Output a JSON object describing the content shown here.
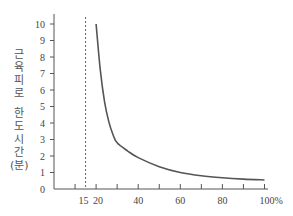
{
  "chart_data": {
    "type": "line",
    "title": "",
    "xlabel": "",
    "ylabel": "근육피로 한도시간 (분)",
    "ylabel_lines": [
      "근",
      "육",
      "피",
      "로",
      "",
      "한",
      "도",
      "시",
      "간",
      "(분)"
    ],
    "x_tick_labels": [
      "15",
      "20",
      "40",
      "60",
      "80",
      "100%"
    ],
    "x_tick_values": [
      15,
      20,
      40,
      60,
      80,
      100
    ],
    "x_minor_ticks": [
      10,
      20,
      30,
      40,
      50,
      60,
      70,
      80,
      90,
      100
    ],
    "y_tick_labels": [
      "0",
      "1",
      "2",
      "3",
      "4",
      "5",
      "6",
      "7",
      "8",
      "9",
      "10"
    ],
    "xlim": [
      0,
      100
    ],
    "ylim": [
      0,
      10
    ],
    "grid": false,
    "reference_line": {
      "x": 15,
      "style": "dashed"
    },
    "series": [
      {
        "name": "muscle fatigue endurance time",
        "x": [
          20,
          22,
          24,
          26,
          28,
          30,
          35,
          40,
          50,
          60,
          70,
          80,
          90,
          100
        ],
        "y": [
          10,
          7.2,
          5.3,
          4.1,
          3.3,
          2.8,
          2.3,
          1.9,
          1.35,
          1.0,
          0.8,
          0.68,
          0.6,
          0.55
        ]
      }
    ]
  }
}
